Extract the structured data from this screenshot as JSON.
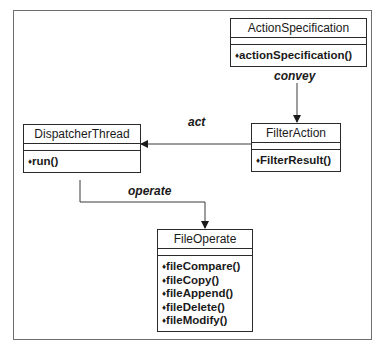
{
  "diagram": {
    "type": "uml-class-diagram",
    "classes": {
      "action_specification": {
        "name": "ActionSpecification",
        "operations": [
          "actionSpecification()"
        ]
      },
      "filter_action": {
        "name": "FilterAction",
        "operations": [
          "FilterResult()"
        ]
      },
      "dispatcher_thread": {
        "name": "DispatcherThread",
        "operations": [
          "run()"
        ]
      },
      "file_operate": {
        "name": "FileOperate",
        "operations": [
          "fileCompare()",
          "fileCopy()",
          "fileAppend()",
          "fileDelete()",
          "fileModify()"
        ]
      }
    },
    "associations": [
      {
        "from": "ActionSpecification",
        "to": "FilterAction",
        "label": "convey"
      },
      {
        "from": "FilterAction",
        "to": "DispatcherThread",
        "label": "act"
      },
      {
        "from": "DispatcherThread",
        "to": "FileOperate",
        "label": "operate"
      }
    ],
    "operation_bullet": "♦"
  }
}
